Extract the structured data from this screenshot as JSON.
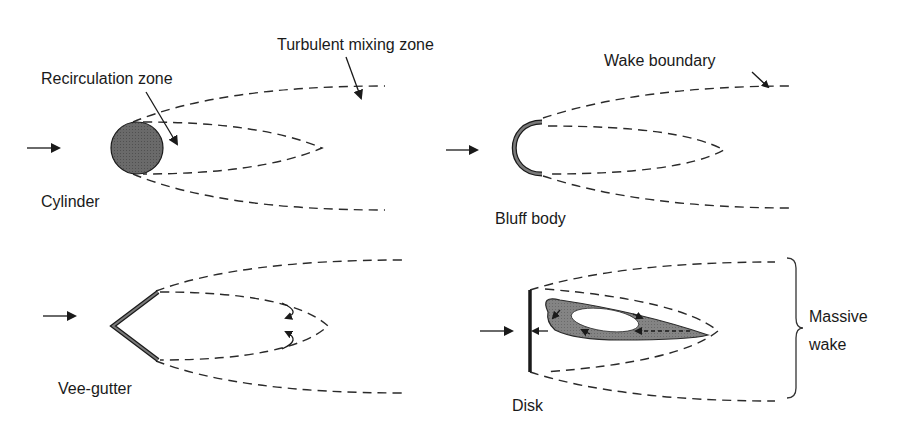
{
  "figure": {
    "panels": [
      {
        "name": "cylinder",
        "label": "Cylinder",
        "annotations": [
          "Recirculation zone",
          "Turbulent mixing zone"
        ]
      },
      {
        "name": "bluff-body",
        "label": "Bluff body",
        "annotations": [
          "Wake boundary"
        ]
      },
      {
        "name": "vee-gutter",
        "label": "Vee-gutter",
        "annotations": []
      },
      {
        "name": "disk",
        "label": "Disk",
        "annotations": [
          "Massive",
          "wake"
        ]
      }
    ],
    "colors": {
      "ink": "#1a1a1a",
      "fill_dark": "#5a5a5a",
      "fill_mid": "#7a7a7a",
      "background": "#ffffff"
    }
  }
}
